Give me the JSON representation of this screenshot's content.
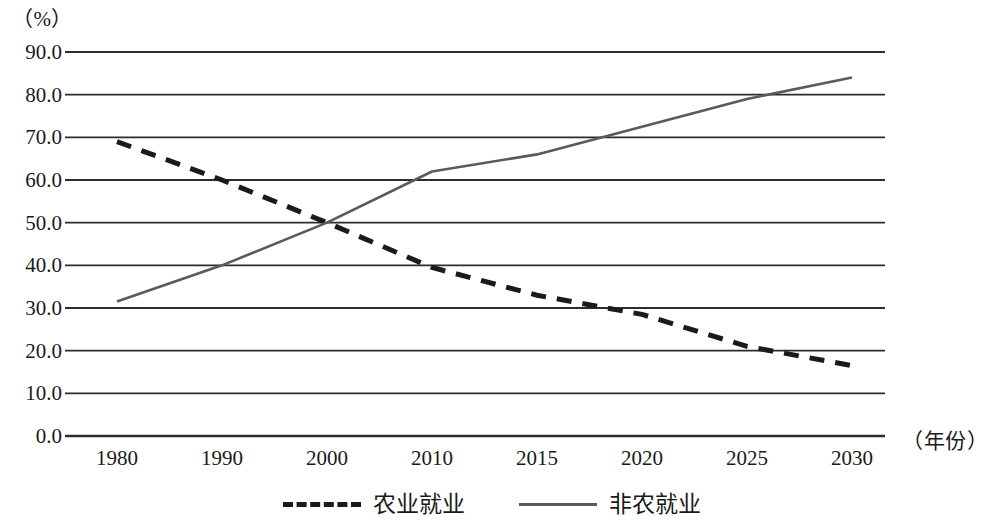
{
  "chart_data": {
    "type": "line",
    "title": "",
    "xlabel": "（年份）",
    "ylabel": "（%）",
    "x": [
      1980,
      1990,
      2000,
      2010,
      2015,
      2020,
      2025,
      2030
    ],
    "categories": [
      "1980",
      "1990",
      "2000",
      "2010",
      "2015",
      "2020",
      "2025",
      "2030"
    ],
    "ylim": [
      0,
      90
    ],
    "y_ticks": [
      "0.0",
      "10.0",
      "20.0",
      "30.0",
      "40.0",
      "50.0",
      "60.0",
      "70.0",
      "80.0",
      "90.0"
    ],
    "y_tick_values": [
      0,
      10,
      20,
      30,
      40,
      50,
      60,
      70,
      80,
      90
    ],
    "grid": true,
    "legend_position": "bottom",
    "series": [
      {
        "name": "农业就业",
        "style": "dashed",
        "color": "#1b1b1b",
        "values": [
          69.0,
          60.0,
          50.0,
          39.5,
          33.0,
          28.5,
          21.0,
          16.5
        ]
      },
      {
        "name": "非农就业",
        "style": "solid",
        "color": "#5a5a58",
        "values": [
          31.5,
          40.0,
          50.0,
          62.0,
          66.0,
          72.5,
          79.0,
          84.0
        ]
      }
    ]
  },
  "axes": {
    "y_unit_label": "（%）",
    "x_unit_label": "（年份）"
  },
  "legend": {
    "items": [
      {
        "label": "农业就业",
        "style": "dashed"
      },
      {
        "label": "非农就业",
        "style": "solid"
      }
    ]
  }
}
